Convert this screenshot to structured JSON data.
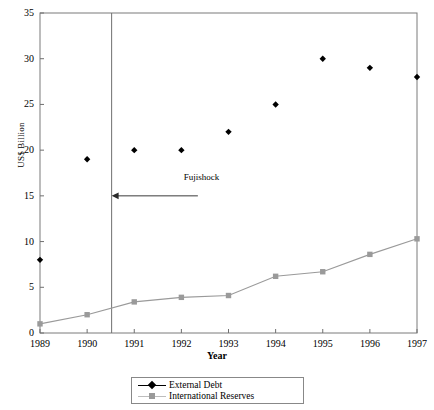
{
  "chart_data": {
    "type": "scatter",
    "title": "",
    "xlabel": "Year",
    "ylabel": "US$ Billion",
    "categories": [
      "1989",
      "1990",
      "1991",
      "1992",
      "1993",
      "1994",
      "1995",
      "1996",
      "1997"
    ],
    "x": [
      1989,
      1990,
      1991,
      1992,
      1993,
      1994,
      1995,
      1996,
      1997
    ],
    "xlim": [
      1989,
      1997
    ],
    "ylim": [
      0,
      35
    ],
    "ytick_labels": [
      "0",
      "5",
      "10",
      "15",
      "20",
      "25",
      "30",
      "35"
    ],
    "ytick_values": [
      0,
      5,
      10,
      15,
      20,
      25,
      30,
      35
    ],
    "xtick_labels": [
      "1989",
      "1990",
      "1991",
      "1992",
      "1993",
      "1994",
      "1995",
      "1996",
      "1997"
    ],
    "grid": false,
    "legend_position": "bottom",
    "series": [
      {
        "name": "External Debt",
        "marker": "diamond",
        "color": "#000000",
        "line": false,
        "values": [
          8,
          19,
          20,
          20,
          22,
          25,
          30,
          29,
          28
        ]
      },
      {
        "name": "International Reserves",
        "marker": "square",
        "color": "#9a9a9a",
        "line": true,
        "values": [
          1,
          2,
          3.4,
          3.9,
          4.1,
          6.2,
          6.7,
          8.6,
          10.3
        ]
      }
    ],
    "annotations": [
      {
        "text": "Fujishock",
        "x": 1992.05,
        "y": 16.9,
        "arrow": {
          "direction": "left",
          "from_x": 1992.35,
          "to_x": 1990.52,
          "y": 15
        }
      }
    ],
    "vertical_divider": {
      "x": 1990.52,
      "color": "#6f6f6f"
    }
  },
  "legend": {
    "items": [
      {
        "label": "External Debt",
        "marker": "diamond-marker",
        "color": "#000000"
      },
      {
        "label": "International Reserves",
        "marker": "square-marker",
        "color": "#9a9a9a"
      }
    ]
  },
  "axes": {
    "y_title": "US$ Billion",
    "x_title": "Year"
  }
}
